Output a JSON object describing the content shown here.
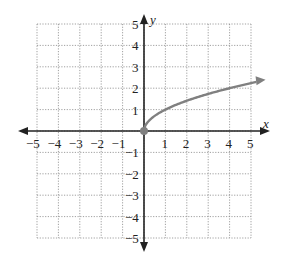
{
  "chart_data": {
    "type": "line",
    "title": "",
    "xlabel": "x",
    "ylabel": "y",
    "xlim": [
      -5,
      5
    ],
    "ylim": [
      -5,
      5
    ],
    "grid": true,
    "x_ticks": [
      "−5",
      "−4",
      "−3",
      "−2",
      "−1",
      "1",
      "2",
      "3",
      "4",
      "5"
    ],
    "y_ticks": [
      "5",
      "4",
      "3",
      "2",
      "1",
      "−1",
      "−2",
      "−3",
      "−4",
      "−5"
    ],
    "series": [
      {
        "name": "y = √x",
        "x": [
          0,
          0.25,
          1,
          2,
          3,
          4,
          5.4
        ],
        "y": [
          0,
          0.5,
          1,
          1.41,
          1.73,
          2,
          2.32
        ],
        "start_point": [
          0,
          0
        ],
        "arrow_end": true,
        "color": "#808080"
      }
    ]
  },
  "colors": {
    "axis": "#222222",
    "grid": "#888888",
    "curve": "#808080"
  }
}
